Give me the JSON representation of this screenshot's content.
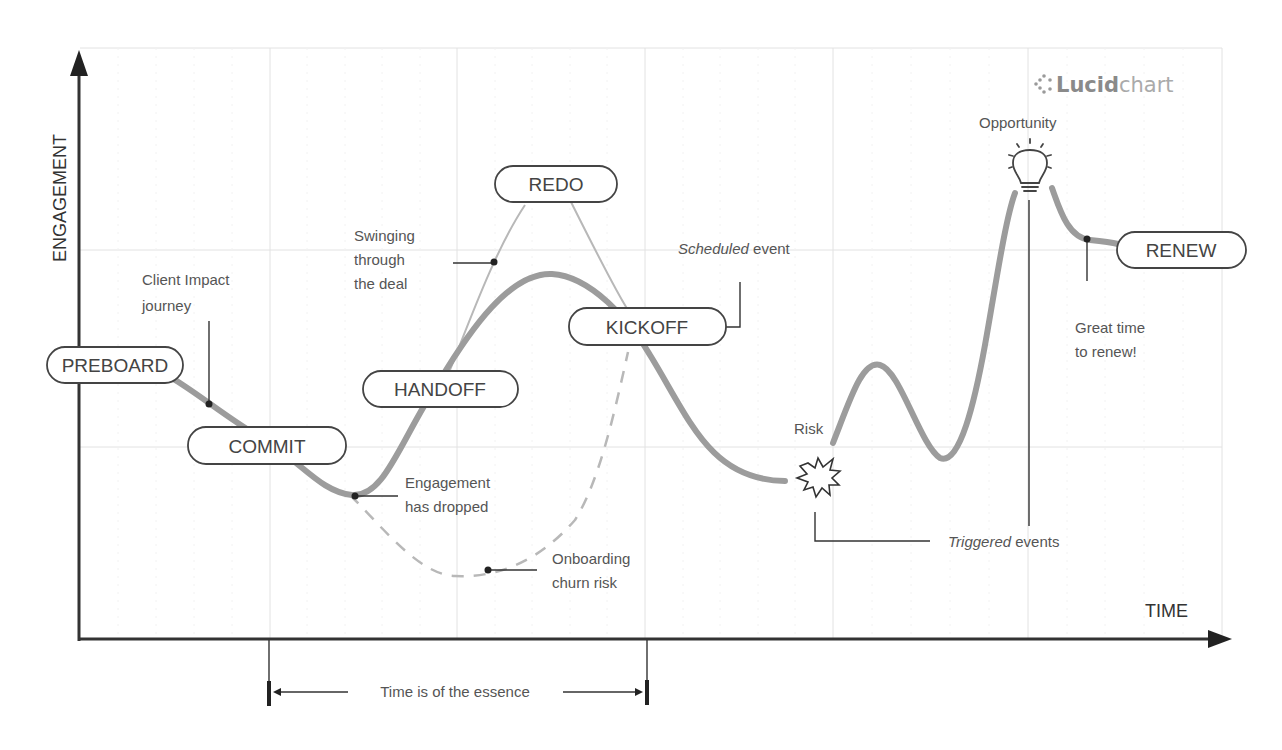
{
  "diagram": {
    "axes": {
      "y_label": "ENGAGEMENT",
      "x_label": "TIME"
    },
    "logo": {
      "bold": "Lucid",
      "light": "chart",
      "icon": "lucidchart-logo-icon"
    },
    "stages": [
      {
        "id": "preboard",
        "label": "PREBOARD"
      },
      {
        "id": "commit",
        "label": "COMMIT"
      },
      {
        "id": "handoff",
        "label": "HANDOFF"
      },
      {
        "id": "redo",
        "label": "REDO"
      },
      {
        "id": "kickoff",
        "label": "KICKOFF"
      },
      {
        "id": "renew",
        "label": "RENEW"
      }
    ],
    "annotations": {
      "client_impact": [
        "Client Impact",
        "journey"
      ],
      "swinging": [
        "Swinging",
        "through",
        "the deal"
      ],
      "engagement_dropped": [
        "Engagement",
        "has dropped"
      ],
      "churn_risk": [
        "Onboarding",
        "churn risk"
      ],
      "scheduled_italic": "Scheduled",
      "scheduled_rest": " event",
      "risk": "Risk",
      "opportunity": "Opportunity",
      "great_time": [
        "Great time",
        "to renew!"
      ],
      "triggered_italic": "Triggered",
      "triggered_rest": " events"
    },
    "timespan": {
      "label": "Time is of the essence"
    },
    "icons": {
      "risk": "explosion-burst-icon",
      "opportunity": "lightbulb-icon"
    },
    "colors": {
      "main_curve": "#9a9a9a",
      "redo_curve": "#b5b5b5",
      "dashed_curve": "#b5b5b5",
      "axis": "#333333",
      "grid": "#e2e2e2",
      "text": "#555555"
    }
  }
}
